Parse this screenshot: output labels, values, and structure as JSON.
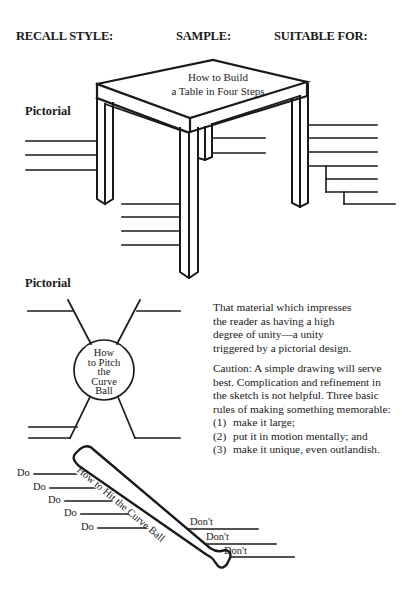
{
  "headers": {
    "recall_style": "RECALL STYLE:",
    "sample": "SAMPLE:",
    "suitable_for": "SUITABLE FOR:"
  },
  "section1": {
    "label": "Pictorial",
    "diagram": {
      "type": "table-drawing",
      "title_line1": "How to Build",
      "title_line2": "a Table in Four Steps"
    }
  },
  "section2": {
    "label": "Pictorial",
    "diagram": {
      "type": "ball-diagram",
      "title_lines": [
        "How",
        "to Pitch",
        "the",
        "Curve",
        "Ball"
      ]
    },
    "description": "That material which impresses the reader as having a high degree of unity—a unity triggered by a pictorial design.",
    "description_lines": [
      "That material which impresses",
      "the reader as having a high",
      "degree of unity—a unity",
      "triggered by a pictorial design."
    ],
    "caution_lines": [
      "Caution: A simple drawing will serve",
      "best. Complication and refinement in",
      "the sketch is not helpful. Three basic",
      "rules of making something memorable:"
    ],
    "rules": [
      {
        "num": "(1)",
        "text": "make it large;"
      },
      {
        "num": "(2)",
        "text": "put it in motion mentally; and"
      },
      {
        "num": "(3)",
        "text": "make it unique, even outlandish."
      }
    ]
  },
  "section3": {
    "diagram": {
      "type": "bat-diagram",
      "title": "How to Hit the Curve Ball",
      "do_labels": [
        "Do",
        "Do",
        "Do",
        "Do",
        "Do"
      ],
      "dont_labels": [
        "Don't",
        "Don't",
        "Don't"
      ]
    }
  }
}
